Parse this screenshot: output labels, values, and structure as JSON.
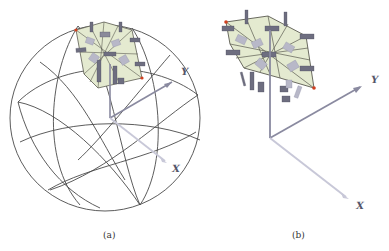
{
  "figure": {
    "panels": [
      {
        "id": "a",
        "caption": "(a)",
        "description": "Wireframe sphere with dome panel of plate elements and coordinate axes",
        "axis_labels": {
          "y": "Y",
          "x": "X"
        }
      },
      {
        "id": "b",
        "caption": "(b)",
        "description": "Close-up dome panel of plate elements with coordinate axes",
        "axis_labels": {
          "y": "Y",
          "x": "X"
        }
      }
    ],
    "colors": {
      "wireframe": "#4a4a4a",
      "panel_fill": "#e4ead0",
      "panel_edge": "#5a5a50",
      "plate": "#6e6e80",
      "plate_light": "#b8b8c8",
      "axis": "#8a8aa0",
      "axis_x": "#c8c8d8",
      "marker": "#d04020"
    }
  }
}
